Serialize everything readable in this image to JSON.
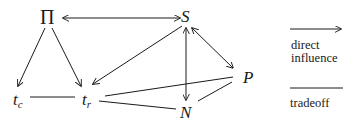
{
  "diagram": {
    "nodes": {
      "pi": {
        "label": "Π"
      },
      "s": {
        "label": "S"
      },
      "tc": {
        "base": "t",
        "sub": "c"
      },
      "tr": {
        "base": "t",
        "sub": "r"
      },
      "p": {
        "label": "P"
      },
      "n": {
        "label": "N"
      }
    },
    "edges": [
      {
        "from": "Π",
        "to": "S",
        "type": "direct influence",
        "direction": "bidirectional"
      },
      {
        "from": "Π",
        "to": "t_c",
        "type": "direct influence",
        "direction": "forward"
      },
      {
        "from": "Π",
        "to": "t_r",
        "type": "direct influence",
        "direction": "forward"
      },
      {
        "from": "S",
        "to": "t_r",
        "type": "direct influence",
        "direction": "forward"
      },
      {
        "from": "S",
        "to": "N",
        "type": "direct influence",
        "direction": "bidirectional"
      },
      {
        "from": "S",
        "to": "P",
        "type": "direct influence",
        "direction": "bidirectional"
      },
      {
        "from": "t_c",
        "to": "t_r",
        "type": "tradeoff"
      },
      {
        "from": "t_r",
        "to": "P",
        "type": "tradeoff"
      },
      {
        "from": "t_r",
        "to": "N",
        "type": "tradeoff"
      },
      {
        "from": "P",
        "to": "N",
        "type": "tradeoff"
      }
    ],
    "colors": {
      "stroke": "#1a1a1a",
      "background": "#ffffff"
    }
  },
  "legend": {
    "direct_influence_line1": "direct",
    "direct_influence_line2": "influence",
    "tradeoff": "tradeoff"
  }
}
